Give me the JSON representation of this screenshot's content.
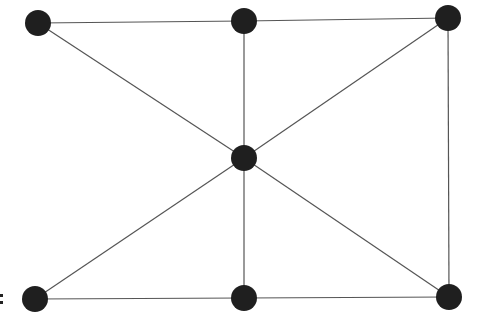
{
  "diagram": {
    "type": "graph",
    "node_color": "#1f1f1f",
    "edge_color": "#555555",
    "node_radius": 13,
    "nodes": [
      {
        "id": "top-left",
        "x": 38,
        "y": 23
      },
      {
        "id": "top-middle",
        "x": 244,
        "y": 21
      },
      {
        "id": "top-right",
        "x": 448,
        "y": 18
      },
      {
        "id": "center",
        "x": 244,
        "y": 158
      },
      {
        "id": "bottom-left",
        "x": 35,
        "y": 299
      },
      {
        "id": "bottom-middle",
        "x": 244,
        "y": 298
      },
      {
        "id": "bottom-right",
        "x": 449,
        "y": 297
      }
    ],
    "edges": [
      [
        "top-left",
        "top-middle"
      ],
      [
        "top-middle",
        "top-right"
      ],
      [
        "top-left",
        "center"
      ],
      [
        "top-middle",
        "center"
      ],
      [
        "top-right",
        "center"
      ],
      [
        "top-right",
        "bottom-right"
      ],
      [
        "center",
        "bottom-left"
      ],
      [
        "center",
        "bottom-middle"
      ],
      [
        "center",
        "bottom-right"
      ],
      [
        "bottom-left",
        "bottom-middle"
      ],
      [
        "bottom-middle",
        "bottom-right"
      ]
    ],
    "marks": [
      ":"
    ]
  }
}
